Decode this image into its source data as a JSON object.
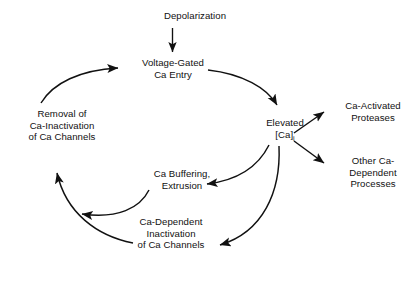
{
  "diagram": {
    "type": "cycle-flowchart",
    "stroke_color": "#111111",
    "background_color": "#ffffff",
    "text_color": "#111111",
    "nodes": [
      {
        "id": "depolarization",
        "lines": [
          "Depolarization"
        ]
      },
      {
        "id": "voltage_gated",
        "lines": [
          "Voltage-Gated",
          "Ca Entry"
        ]
      },
      {
        "id": "elevated",
        "lines": [
          "Elevated",
          "[Ca]"
        ],
        "subscript": "i"
      },
      {
        "id": "ca_activated",
        "lines": [
          "Ca-Activated",
          "Proteases"
        ]
      },
      {
        "id": "other_ca_dependent",
        "lines": [
          "Other Ca-",
          "Dependent",
          "Processes"
        ]
      },
      {
        "id": "ca_dependent_inactivation",
        "lines": [
          "Ca-Dependent",
          "Inactivation",
          "of Ca Channels"
        ]
      },
      {
        "id": "ca_buffering",
        "lines": [
          "Ca Buffering,",
          "Extrusion"
        ]
      },
      {
        "id": "removal",
        "lines": [
          "Removal of",
          "Ca-Inactivation",
          "of Ca Channels"
        ]
      }
    ],
    "edges": [
      {
        "id": "e1",
        "from": "depolarization",
        "to": "voltage_gated",
        "style": "straight"
      },
      {
        "id": "e2",
        "from": "voltage_gated",
        "to": "elevated",
        "style": "curved"
      },
      {
        "id": "e3",
        "from": "elevated",
        "to": "ca_activated",
        "style": "straight"
      },
      {
        "id": "e4",
        "from": "elevated",
        "to": "other_ca_dependent",
        "style": "straight"
      },
      {
        "id": "e5",
        "from": "elevated",
        "to": "ca_buffering",
        "style": "curved"
      },
      {
        "id": "e6",
        "from": "elevated",
        "to": "ca_dependent_inactivation",
        "style": "curved"
      },
      {
        "id": "e7",
        "from": "ca_buffering",
        "to": "removal",
        "style": "curved"
      },
      {
        "id": "e8",
        "from": "ca_dependent_inactivation",
        "to": "removal",
        "style": "curved"
      },
      {
        "id": "e9",
        "from": "removal",
        "to": "voltage_gated",
        "style": "curved"
      }
    ]
  }
}
